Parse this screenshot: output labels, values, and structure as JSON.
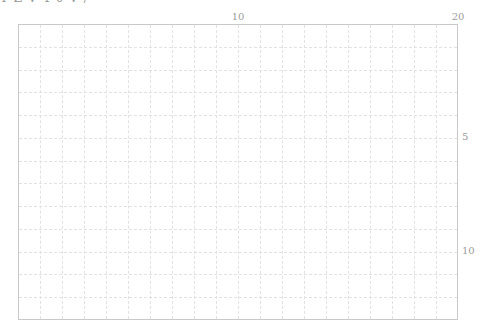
{
  "header": {
    "cut_text": "Y Z  V 4 0 V  /"
  },
  "chart_data": {
    "type": "heatmap",
    "title": "",
    "xlabel": "",
    "ylabel": "",
    "xlim": [
      0,
      20
    ],
    "ylim": [
      0,
      13
    ],
    "y_inverted": true,
    "grid": true,
    "grid_style": "dashed",
    "x_ticks": [
      {
        "value": 10,
        "label": "10"
      },
      {
        "value": 20,
        "label": "20"
      }
    ],
    "y_ticks": [
      {
        "value": 5,
        "label": "5"
      },
      {
        "value": 10,
        "label": "10"
      }
    ],
    "x_axis_position": "top",
    "y_axis_position": "right",
    "columns": 20,
    "rows": 13,
    "series": [],
    "colors": {
      "border": "#c9c9c9",
      "grid": "#e2e2e2",
      "tick_label": "#9c9c9c"
    }
  }
}
